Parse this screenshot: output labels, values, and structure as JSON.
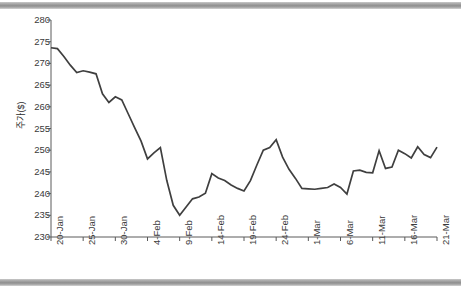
{
  "chart_data": {
    "type": "line",
    "title": "",
    "xlabel": "",
    "ylabel": "주가($)",
    "ylim": [
      230,
      280
    ],
    "y_ticks": [
      230,
      235,
      240,
      245,
      250,
      255,
      260,
      265,
      270,
      275,
      280
    ],
    "grid": false,
    "legend": null,
    "line_color": "#3f3f3f",
    "x_tick_labels": [
      "20-Jan",
      "25-Jan",
      "30-Jan",
      "4-Feb",
      "9-Feb",
      "14-Feb",
      "19-Feb",
      "24-Feb",
      "1-Mar",
      "6-Mar",
      "11-Mar",
      "16-Mar",
      "21-Mar"
    ],
    "x_tick_indices": [
      0,
      5,
      10,
      15,
      20,
      25,
      30,
      35,
      40,
      45,
      50,
      55,
      60
    ],
    "x": [
      "20-Jan",
      "21-Jan",
      "22-Jan",
      "23-Jan",
      "24-Jan",
      "25-Jan",
      "26-Jan",
      "27-Jan",
      "28-Jan",
      "29-Jan",
      "30-Jan",
      "31-Jan",
      "1-Feb",
      "2-Feb",
      "3-Feb",
      "4-Feb",
      "5-Feb",
      "6-Feb",
      "7-Feb",
      "8-Feb",
      "9-Feb",
      "10-Feb",
      "11-Feb",
      "12-Feb",
      "13-Feb",
      "14-Feb",
      "15-Feb",
      "16-Feb",
      "17-Feb",
      "18-Feb",
      "19-Feb",
      "20-Feb",
      "21-Feb",
      "22-Feb",
      "23-Feb",
      "24-Feb",
      "25-Feb",
      "26-Feb",
      "27-Feb",
      "28-Feb",
      "1-Mar",
      "2-Mar",
      "3-Mar",
      "4-Mar",
      "5-Mar",
      "6-Mar",
      "7-Mar",
      "8-Mar",
      "9-Mar",
      "10-Mar",
      "11-Mar",
      "12-Mar",
      "13-Mar",
      "14-Mar",
      "15-Mar",
      "16-Mar",
      "17-Mar",
      "18-Mar",
      "19-Mar",
      "20-Mar",
      "21-Mar"
    ],
    "values": [
      273.6,
      273.4,
      271.6,
      269.6,
      267.9,
      268.3,
      268.0,
      267.6,
      263.0,
      261.0,
      262.3,
      261.6,
      258.4,
      255.2,
      252.1,
      248.0,
      249.4,
      250.6,
      243.0,
      237.3,
      235.0,
      236.9,
      238.8,
      239.2,
      240.1,
      244.6,
      243.6,
      243.0,
      242.0,
      241.2,
      240.6,
      243.0,
      246.6,
      250.0,
      250.6,
      252.4,
      248.4,
      245.6,
      243.5,
      241.2,
      241.1,
      241.0,
      241.2,
      241.4,
      242.2,
      241.4,
      239.9,
      245.2,
      245.4,
      244.9,
      244.8,
      249.9,
      245.8,
      246.1,
      250.0,
      249.2,
      248.2,
      250.8,
      249.0,
      248.3,
      250.7
    ]
  }
}
